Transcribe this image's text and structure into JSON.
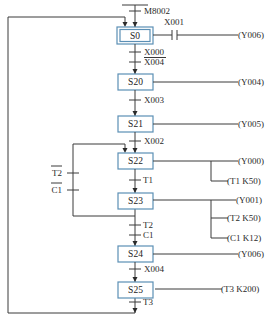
{
  "diagram": {
    "type": "SFC (sequential function chart)",
    "init_transition": "M8002",
    "steps": [
      {
        "id": "S0",
        "label": "S0",
        "initial": true,
        "actions": [
          {
            "contact": "X001",
            "output": "(Y006)"
          }
        ]
      },
      {
        "id": "S20",
        "label": "S20",
        "actions": [
          {
            "output": "(Y004)"
          }
        ]
      },
      {
        "id": "S21",
        "label": "S21",
        "actions": [
          {
            "output": "(Y005)"
          }
        ]
      },
      {
        "id": "S22",
        "label": "S22",
        "actions": [
          {
            "output": "(Y000)"
          },
          {
            "output": "(T1  K50)"
          }
        ]
      },
      {
        "id": "S23",
        "label": "S23",
        "actions": [
          {
            "output": "(Y001)"
          },
          {
            "output": "(T2  K50)"
          },
          {
            "output": "(C1  K12)"
          }
        ]
      },
      {
        "id": "S24",
        "label": "S24",
        "actions": [
          {
            "output": "(Y006)"
          }
        ]
      },
      {
        "id": "S25",
        "label": "S25",
        "actions": [
          {
            "output": "(T3  K200)"
          }
        ]
      }
    ],
    "transitions": {
      "s0_s20_a": "X000",
      "s0_s20_b": "X004",
      "s20_s21": "X003",
      "s21_s22": "X002",
      "s22_s23": "T1",
      "s23_s24_a": "T2",
      "s23_s24_b": "C1",
      "s24_s25": "X004",
      "s25_s0": "T3",
      "loop_t2": "T2",
      "loop_c1": "C1"
    },
    "colors": {
      "box_border": "#5b8fb5",
      "line": "#3a3a3a"
    }
  }
}
